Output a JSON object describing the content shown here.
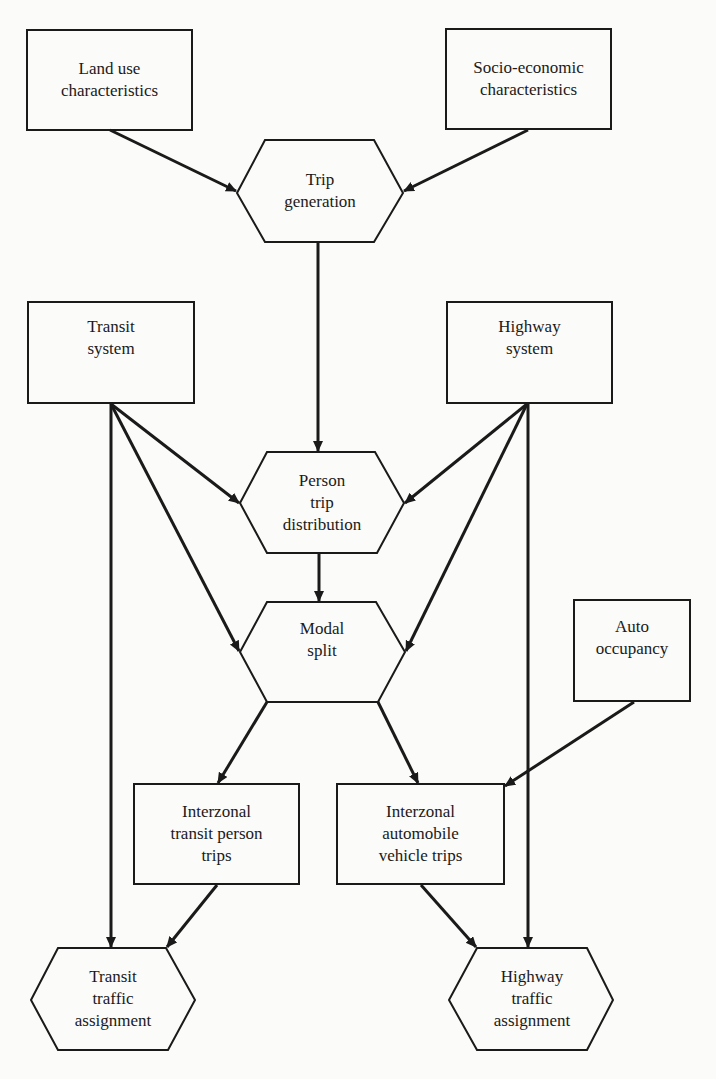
{
  "diagram": {
    "type": "flowchart",
    "nodes": [
      {
        "id": "land_use",
        "shape": "rectangle",
        "label": "Land use\ncharacteristics"
      },
      {
        "id": "socio_economic",
        "shape": "rectangle",
        "label": "Socio-economic\ncharacteristics"
      },
      {
        "id": "trip_generation",
        "shape": "hexagon",
        "label": "Trip\ngeneration"
      },
      {
        "id": "transit_system",
        "shape": "rectangle",
        "label": "Transit\nsystem"
      },
      {
        "id": "highway_system",
        "shape": "rectangle",
        "label": "Highway\nsystem"
      },
      {
        "id": "person_trip_distribution",
        "shape": "hexagon",
        "label": "Person\ntrip\ndistribution"
      },
      {
        "id": "modal_split",
        "shape": "hexagon",
        "label": "Modal\nsplit"
      },
      {
        "id": "auto_occupancy",
        "shape": "rectangle",
        "label": "Auto\noccupancy"
      },
      {
        "id": "interzonal_transit",
        "shape": "rectangle",
        "label": "Interzonal\ntransit person\ntrips"
      },
      {
        "id": "interzonal_auto",
        "shape": "rectangle",
        "label": "Interzonal\nautomobile\nvehicle trips"
      },
      {
        "id": "transit_assignment",
        "shape": "hexagon",
        "label": "Transit\ntraffic\nassignment"
      },
      {
        "id": "highway_assignment",
        "shape": "hexagon",
        "label": "Highway\ntraffic\nassignment"
      }
    ],
    "edges": [
      {
        "from": "land_use",
        "to": "trip_generation"
      },
      {
        "from": "socio_economic",
        "to": "trip_generation"
      },
      {
        "from": "trip_generation",
        "to": "person_trip_distribution"
      },
      {
        "from": "transit_system",
        "to": "person_trip_distribution"
      },
      {
        "from": "highway_system",
        "to": "person_trip_distribution"
      },
      {
        "from": "transit_system",
        "to": "modal_split"
      },
      {
        "from": "highway_system",
        "to": "modal_split"
      },
      {
        "from": "person_trip_distribution",
        "to": "modal_split"
      },
      {
        "from": "modal_split",
        "to": "interzonal_transit"
      },
      {
        "from": "modal_split",
        "to": "interzonal_auto"
      },
      {
        "from": "auto_occupancy",
        "to": "interzonal_auto"
      },
      {
        "from": "transit_system",
        "to": "transit_assignment"
      },
      {
        "from": "interzonal_transit",
        "to": "transit_assignment"
      },
      {
        "from": "highway_system",
        "to": "highway_assignment"
      },
      {
        "from": "interzonal_auto",
        "to": "highway_assignment"
      }
    ]
  },
  "labels": {
    "land_use": "Land use\ncharacteristics",
    "socio_economic": "Socio-economic\ncharacteristics",
    "trip_generation": "Trip\ngeneration",
    "transit_system": "Transit\nsystem",
    "highway_system": "Highway\nsystem",
    "person_trip_distribution": "Person\ntrip\ndistribution",
    "modal_split": "Modal\nsplit",
    "auto_occupancy": "Auto\noccupancy",
    "interzonal_transit": "Interzonal\ntransit person\ntrips",
    "interzonal_auto": "Interzonal\nautomobile\nvehicle trips",
    "transit_assignment": "Transit\ntraffic\nassignment",
    "highway_assignment": "Highway\ntraffic\nassignment"
  },
  "colors": {
    "stroke": "#1a1a1a",
    "background": "#fbfbf9"
  }
}
